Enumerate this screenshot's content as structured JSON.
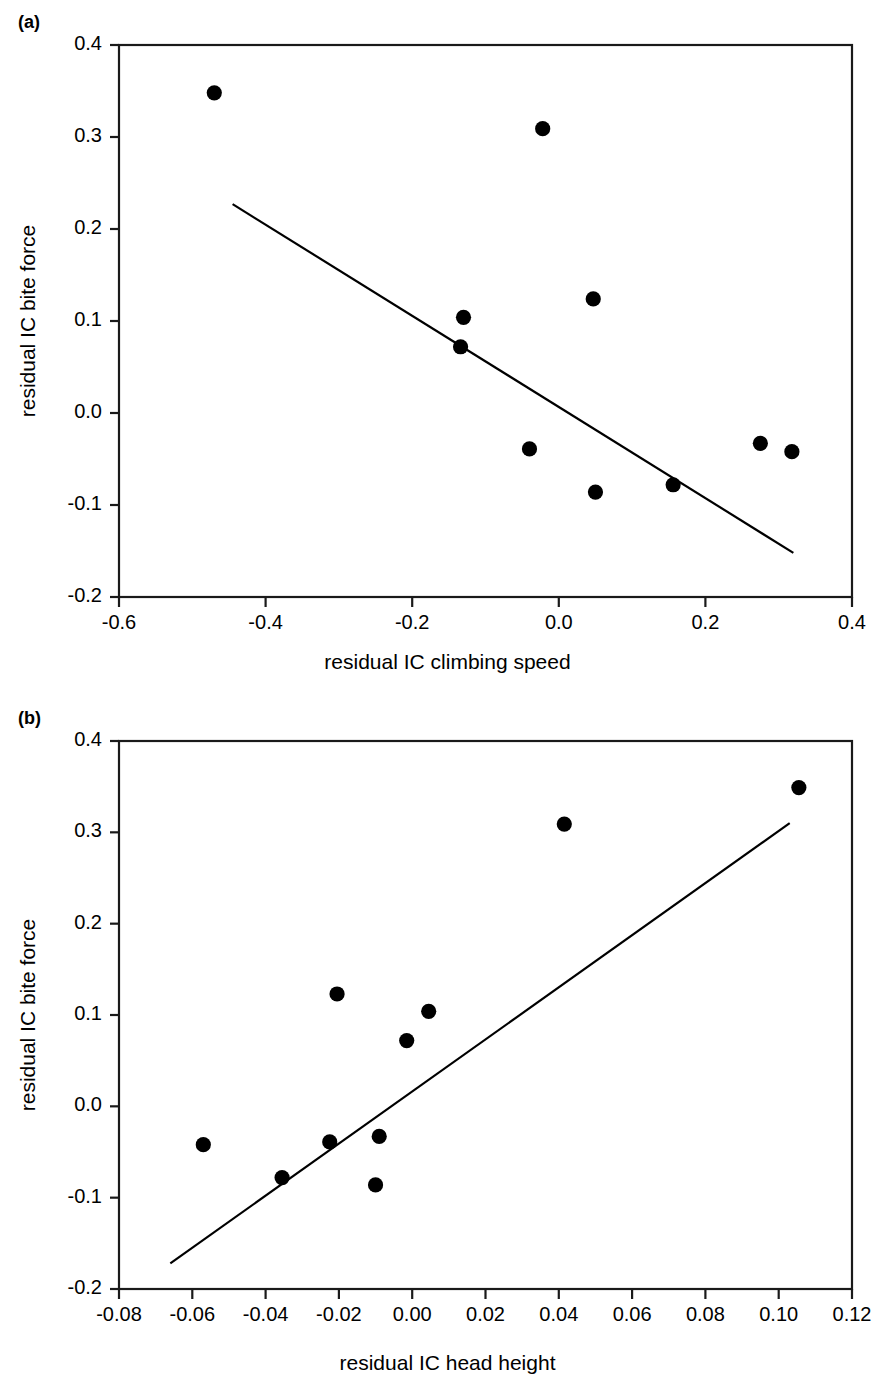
{
  "figure": {
    "panels": [
      {
        "label": "(a)"
      },
      {
        "label": "(b)"
      }
    ]
  },
  "chart_data": [
    {
      "type": "scatter",
      "panel_label": "(a)",
      "title": "",
      "xlabel": "residual IC climbing speed",
      "ylabel": "residual IC bite force",
      "xlim": [
        -0.6,
        0.4
      ],
      "ylim": [
        -0.2,
        0.4
      ],
      "xticks": [
        "-0.6",
        "-0.4",
        "-0.2",
        "0.0",
        "0.2",
        "0.4"
      ],
      "xtick_values": [
        -0.6,
        -0.4,
        -0.2,
        0.0,
        0.2,
        0.4
      ],
      "yticks": [
        "0.4",
        "0.3",
        "0.2",
        "0.1",
        "0.0",
        "-0.1",
        "-0.2"
      ],
      "ytick_values": [
        0.4,
        0.3,
        0.2,
        0.1,
        0.0,
        -0.1,
        -0.2
      ],
      "grid": false,
      "legend": "none",
      "marker": "filled-circle",
      "marker_color": "#000000",
      "points": [
        {
          "x": -0.47,
          "y": 0.348
        },
        {
          "x": -0.022,
          "y": 0.309
        },
        {
          "x": -0.13,
          "y": 0.104
        },
        {
          "x": -0.134,
          "y": 0.072
        },
        {
          "x": 0.047,
          "y": 0.124
        },
        {
          "x": -0.04,
          "y": -0.039
        },
        {
          "x": 0.05,
          "y": -0.086
        },
        {
          "x": 0.156,
          "y": -0.078
        },
        {
          "x": 0.275,
          "y": -0.033
        },
        {
          "x": 0.318,
          "y": -0.042
        }
      ],
      "fit_line": {
        "type": "linear-regression",
        "x_start": -0.445,
        "y_start": 0.227,
        "x_end": 0.32,
        "y_end": -0.152,
        "color": "#000000"
      }
    },
    {
      "type": "scatter",
      "panel_label": "(b)",
      "title": "",
      "xlabel": "residual IC head height",
      "ylabel": "residual IC bite force",
      "xlim": [
        -0.08,
        0.12
      ],
      "ylim": [
        -0.2,
        0.4
      ],
      "xticks": [
        "-0.08",
        "-0.06",
        "-0.04",
        "-0.02",
        "0.00",
        "0.02",
        "0.04",
        "0.06",
        "0.08",
        "0.10",
        "0.12"
      ],
      "xtick_values": [
        -0.08,
        -0.06,
        -0.04,
        -0.02,
        0.0,
        0.02,
        0.04,
        0.06,
        0.08,
        0.1,
        0.12
      ],
      "yticks": [
        "0.4",
        "0.3",
        "0.2",
        "0.1",
        "0.0",
        "-0.1",
        "-0.2"
      ],
      "ytick_values": [
        0.4,
        0.3,
        0.2,
        0.1,
        0.0,
        -0.1,
        -0.2
      ],
      "grid": false,
      "legend": "none",
      "marker": "filled-circle",
      "marker_color": "#000000",
      "points": [
        {
          "x": 0.1055,
          "y": 0.349
        },
        {
          "x": 0.0415,
          "y": 0.309
        },
        {
          "x": -0.0205,
          "y": 0.123
        },
        {
          "x": 0.0045,
          "y": 0.104
        },
        {
          "x": -0.0015,
          "y": 0.072
        },
        {
          "x": -0.057,
          "y": -0.042
        },
        {
          "x": -0.0225,
          "y": -0.039
        },
        {
          "x": -0.009,
          "y": -0.033
        },
        {
          "x": -0.0355,
          "y": -0.078
        },
        {
          "x": -0.01,
          "y": -0.086
        }
      ],
      "fit_line": {
        "type": "linear-regression",
        "x_start": -0.066,
        "y_start": -0.172,
        "x_end": 0.103,
        "y_end": 0.31,
        "color": "#000000"
      }
    }
  ]
}
